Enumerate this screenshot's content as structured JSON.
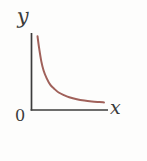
{
  "figure": {
    "background_color": "#fdfdfc",
    "axis_color": "#3c3c3c",
    "curve_color": "#a0615a",
    "labels": {
      "y_axis": "y",
      "x_axis": "x",
      "origin": "0"
    }
  },
  "chart_data": {
    "type": "line",
    "title": "",
    "subtitle": "",
    "xlabel": "x",
    "ylabel": "y",
    "origin_label": "0",
    "grid": false,
    "legend": null,
    "axis_style": "two-axis-corner",
    "xlim": [
      0,
      10
    ],
    "ylim": [
      0,
      10
    ],
    "x_ticks": [],
    "y_ticks": [],
    "series": [
      {
        "name": "y = k / x",
        "color": "#a0615a",
        "x": [
          0.8,
          1.0,
          1.3,
          1.6,
          2.0,
          2.5,
          3.0,
          3.6,
          4.3,
          5.0,
          6.0,
          7.0,
          8.0,
          9.0,
          9.6
        ],
        "y": [
          9.7,
          8.2,
          6.4,
          5.2,
          4.2,
          3.3,
          2.8,
          2.3,
          1.95,
          1.68,
          1.42,
          1.24,
          1.12,
          1.04,
          1.0
        ]
      }
    ],
    "annotations": []
  }
}
